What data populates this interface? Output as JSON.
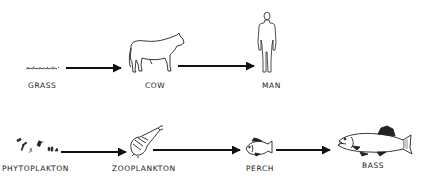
{
  "diagram": {
    "type": "food-chain",
    "rows": [
      {
        "id": "terrestrial",
        "nodes": [
          {
            "id": "grass",
            "label": "GRASS",
            "icon": "grass-icon"
          },
          {
            "id": "cow",
            "label": "COW",
            "icon": "cow-icon"
          },
          {
            "id": "man",
            "label": "MAN",
            "icon": "man-icon"
          }
        ],
        "edges": [
          [
            "grass",
            "cow"
          ],
          [
            "cow",
            "man"
          ]
        ]
      },
      {
        "id": "aquatic",
        "nodes": [
          {
            "id": "phytoplankton",
            "label": "PHYTOPLAKTON",
            "icon": "phytoplankton-icon"
          },
          {
            "id": "zooplankton",
            "label": "ZOOPLANKTON",
            "icon": "zooplankton-icon"
          },
          {
            "id": "perch",
            "label": "PERCH",
            "icon": "perch-icon"
          },
          {
            "id": "bass",
            "label": "BASS",
            "icon": "bass-icon"
          }
        ],
        "edges": [
          [
            "phytoplankton",
            "zooplankton"
          ],
          [
            "zooplankton",
            "perch"
          ],
          [
            "perch",
            "bass"
          ]
        ]
      }
    ],
    "colors": {
      "ink": "#111111",
      "background": "#ffffff"
    }
  }
}
